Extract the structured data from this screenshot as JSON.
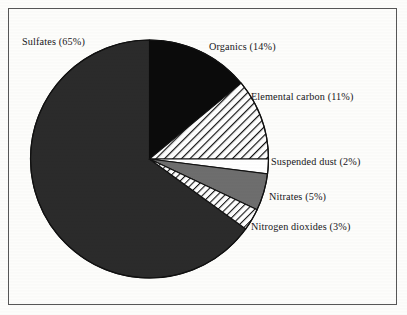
{
  "figure": {
    "background_color": "#fdfdfb",
    "frame_color": "#575757",
    "text_color": "#17161a"
  },
  "labels": {
    "sulfates": "Sulfates (65%)",
    "organics": "Organics (14%)",
    "elemental_carbon": "Elemental carbon (11%)",
    "suspended_dust": "Suspended dust (2%)",
    "nitrates": "Nitrates (5%)",
    "nitrogen_dioxides": "Nitrogen dioxides (3%)"
  },
  "chart_data": {
    "type": "pie",
    "title": "",
    "subtitle": "",
    "xlabel": "",
    "ylabel": "",
    "legend_position": "external-callout-labels",
    "grid": false,
    "start_angle_deg": 0,
    "direction": "clockwise",
    "center": {
      "x": 149.5,
      "y": 159
    },
    "radius": 119,
    "total": 100,
    "units": "percent",
    "categories": [
      "Organics",
      "Elemental carbon",
      "Suspended dust",
      "Nitrates",
      "Nitrogen dioxides",
      "Sulfates"
    ],
    "values": [
      14,
      11,
      2,
      5,
      3,
      65
    ],
    "slices": [
      {
        "name": "Organics",
        "label": "Organics (14%)",
        "value": 14,
        "fill_style": "solid",
        "color": "#0b0b0b",
        "start_deg": 0,
        "end_deg": 50.4
      },
      {
        "name": "Elemental carbon",
        "label": "Elemental carbon (11%)",
        "value": 11,
        "fill_style": "diagonal-hatch",
        "color": "#ffffff",
        "start_deg": 50.4,
        "end_deg": 90.0
      },
      {
        "name": "Suspended dust",
        "label": "Suspended dust (2%)",
        "value": 2,
        "fill_style": "empty",
        "color": "#ffffff",
        "start_deg": 90.0,
        "end_deg": 97.2
      },
      {
        "name": "Nitrates",
        "label": "Nitrates (5%)",
        "value": 5,
        "fill_style": "solid",
        "color": "#6e6e6e",
        "start_deg": 97.2,
        "end_deg": 115.2
      },
      {
        "name": "Nitrogen dioxides",
        "label": "Nitrogen dioxides (3%)",
        "value": 3,
        "fill_style": "diagonal-hatch",
        "color": "#ffffff",
        "start_deg": 115.2,
        "end_deg": 126.0
      },
      {
        "name": "Sulfates",
        "label": "Sulfates (65%)",
        "value": 65,
        "fill_style": "solid",
        "color": "#2b2b2b",
        "start_deg": 126.0,
        "end_deg": 360.0
      }
    ]
  }
}
